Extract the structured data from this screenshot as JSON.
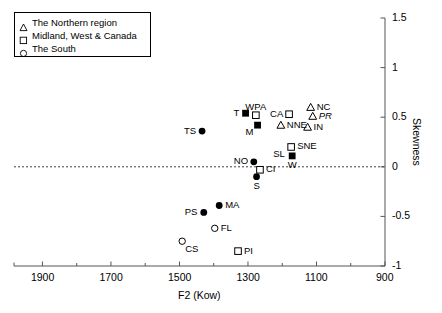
{
  "chart_data": {
    "type": "scatter",
    "title": "",
    "xlabel": "F2 (Kow)",
    "ylabel": "Skewness",
    "xlim": [
      1983,
      900
    ],
    "ylim": [
      -1,
      1.5
    ],
    "x_inverted": true,
    "x_ticks": [
      1900,
      1700,
      1500,
      1300,
      1100,
      900
    ],
    "x_tick_labels": [
      "1900",
      "1700",
      "1500",
      "1300",
      "1100",
      "900"
    ],
    "x_minor_tick_step": 100,
    "y_ticks": [
      -1,
      -0.5,
      0,
      0.5,
      1,
      1.5
    ],
    "y_tick_labels": [
      "-1",
      "-0.5",
      "0",
      "0.5",
      "1",
      "1.5"
    ],
    "y_axis_position": "right",
    "grid": false,
    "zero_line": {
      "value": 0,
      "style": "dashed"
    },
    "legend": {
      "position": "top-left",
      "entries": [
        {
          "marker": "triangle-open",
          "label": "The Northern region"
        },
        {
          "marker": "square-open",
          "label": "Midland, West & Canada"
        },
        {
          "marker": "circle-open",
          "label": "The South"
        }
      ]
    },
    "points": [
      {
        "label": "TS",
        "x": 1434,
        "y": 0.36,
        "marker": "circle-filled",
        "label_pos": "left",
        "italic": false
      },
      {
        "label": "T",
        "x": 1307,
        "y": 0.54,
        "marker": "square-filled",
        "label_pos": "left",
        "italic": false
      },
      {
        "label": "WPA",
        "x": 1277,
        "y": 0.52,
        "marker": "square-open",
        "label_pos": "above",
        "italic": false
      },
      {
        "label": "M",
        "x": 1272,
        "y": 0.42,
        "marker": "square-filled",
        "label_pos": "below-left",
        "italic": false
      },
      {
        "label": "CA",
        "x": 1180,
        "y": 0.53,
        "marker": "square-open",
        "label_pos": "left",
        "italic": false
      },
      {
        "label": "NC",
        "x": 1117,
        "y": 0.6,
        "marker": "triangle-open",
        "label_pos": "right",
        "italic": false
      },
      {
        "label": "PR",
        "x": 1111,
        "y": 0.51,
        "marker": "triangle-open",
        "label_pos": "right",
        "italic": true
      },
      {
        "label": "IN",
        "x": 1126,
        "y": 0.4,
        "marker": "triangle-open",
        "label_pos": "right",
        "italic": false
      },
      {
        "label": "NNE",
        "x": 1204,
        "y": 0.42,
        "marker": "triangle-open",
        "label_pos": "right",
        "italic": false
      },
      {
        "label": "SNE",
        "x": 1174,
        "y": 0.2,
        "marker": "square-open",
        "label_pos": "right",
        "italic": false
      },
      {
        "label": "W",
        "x": 1171,
        "y": 0.11,
        "marker": "square-filled",
        "label_pos": "below",
        "italic": false
      },
      {
        "label": "SL",
        "x": 1174,
        "y": 0.12,
        "marker": "none",
        "label_pos": "left",
        "italic": false
      },
      {
        "label": "NO",
        "x": 1283,
        "y": 0.05,
        "marker": "circle-filled",
        "label_pos": "left",
        "italic": false
      },
      {
        "label": "CI",
        "x": 1265,
        "y": -0.03,
        "marker": "square-open",
        "label_pos": "right",
        "italic": false
      },
      {
        "label": "S",
        "x": 1275,
        "y": -0.1,
        "marker": "circle-filled",
        "label_pos": "below",
        "italic": false
      },
      {
        "label": "MA",
        "x": 1384,
        "y": -0.39,
        "marker": "circle-filled",
        "label_pos": "right",
        "italic": false
      },
      {
        "label": "PS",
        "x": 1429,
        "y": -0.46,
        "marker": "circle-filled",
        "label_pos": "left",
        "italic": false
      },
      {
        "label": "FL",
        "x": 1397,
        "y": -0.62,
        "marker": "circle-open",
        "label_pos": "right",
        "italic": false
      },
      {
        "label": "CS",
        "x": 1492,
        "y": -0.75,
        "marker": "circle-open",
        "label_pos": "below-right",
        "italic": false
      },
      {
        "label": "PI",
        "x": 1329,
        "y": -0.85,
        "marker": "square-open",
        "label_pos": "right",
        "italic": false
      }
    ]
  },
  "caption": ""
}
